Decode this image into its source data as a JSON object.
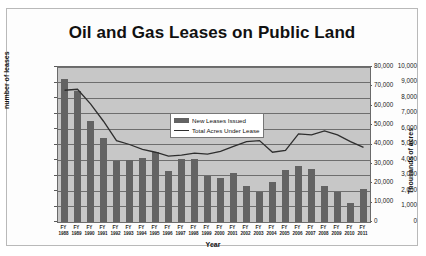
{
  "chart_data": {
    "type": "bar",
    "title": "Oil and Gas Leases on Public Land",
    "xlabel": "Year",
    "ylabel": "number of leases",
    "ylabel_right": "Thousands of  acres",
    "ylim": [
      0,
      10000
    ],
    "ylim_right": [
      0,
      80000
    ],
    "yticks": [
      "0",
      "1,000",
      "2,000",
      "3,000",
      "4,000",
      "5,000",
      "6,000",
      "7,000",
      "8,000",
      "9,000",
      "10,000"
    ],
    "yticks_right": [
      "0",
      "10,000",
      "20,000",
      "30,000",
      "40,000",
      "50,000",
      "60,000",
      "70,000",
      "80,000"
    ],
    "grid": true,
    "legend_position": "center",
    "categories": [
      "FY 1988",
      "FY 1989",
      "FY 1990",
      "FY 1991",
      "FY 1992",
      "FY 1993",
      "FY 1994",
      "FY 1995",
      "FY 1996",
      "FY 1997",
      "FY 1998",
      "FY 1999",
      "FY 2000",
      "FY 2001",
      "FY 2002",
      "FY 2003",
      "FY 2004",
      "FY 2005",
      "FY 2006",
      "FY 2007",
      "FY 2008",
      "FY 2009",
      "FY 2010",
      "FY 2011"
    ],
    "category_lines": [
      [
        "FY",
        "1988"
      ],
      [
        "FY",
        "1989"
      ],
      [
        "FY",
        "1990"
      ],
      [
        "FY",
        "1991"
      ],
      [
        "FY",
        "1992"
      ],
      [
        "FY",
        "1993"
      ],
      [
        "FY",
        "1994"
      ],
      [
        "FY",
        "1995"
      ],
      [
        "FY",
        "1996"
      ],
      [
        "FY",
        "1997"
      ],
      [
        "FY",
        "1998"
      ],
      [
        "FY",
        "1999"
      ],
      [
        "FY",
        "2000"
      ],
      [
        "FY",
        "2001"
      ],
      [
        "FY",
        "2002"
      ],
      [
        "FY",
        "2003"
      ],
      [
        "FY",
        "2004"
      ],
      [
        "FY",
        "2005"
      ],
      [
        "FY",
        "2006"
      ],
      [
        "FY",
        "2007"
      ],
      [
        "FY",
        "2008"
      ],
      [
        "FY",
        "2009"
      ],
      [
        "FY",
        "2010"
      ],
      [
        "FY",
        "2011"
      ]
    ],
    "series": [
      {
        "name": "New Leases Issued",
        "type": "bar",
        "axis": "left",
        "color": "#636363",
        "values": [
          9200,
          8450,
          6500,
          5450,
          3950,
          4000,
          4150,
          4500,
          3300,
          4050,
          4050,
          3000,
          2850,
          3150,
          2300,
          1950,
          2600,
          3350,
          3600,
          3400,
          2300,
          1950,
          1200,
          2100
        ]
      },
      {
        "name": "Total Acres Under Lease",
        "type": "line",
        "axis": "right",
        "color": "#2e2e2e",
        "values": [
          68000,
          68500,
          61000,
          52000,
          42000,
          40000,
          37500,
          36000,
          34000,
          34500,
          35500,
          35000,
          36500,
          39000,
          41500,
          42000,
          36000,
          37000,
          45500,
          45000,
          47000,
          45000,
          41500,
          38500
        ]
      }
    ]
  },
  "legend": {
    "items": [
      {
        "label": "New Leases Issued"
      },
      {
        "label": "Total Acres Under Lease"
      }
    ]
  },
  "colors": {
    "bar": "#636363",
    "line": "#2e2e2e",
    "plot_background": "#c7c7c7",
    "frame_background": "#fdfdfd",
    "gridline": "#6e6e6e"
  }
}
